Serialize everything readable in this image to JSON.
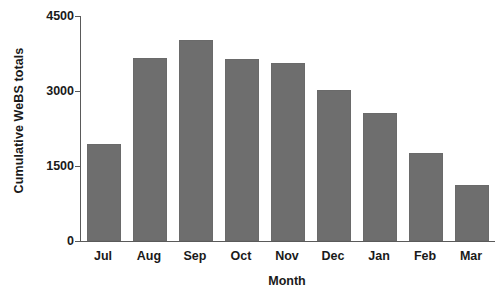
{
  "chart_data": {
    "type": "bar",
    "title": "",
    "xlabel": "Month",
    "ylabel": "Cumulative WeBS totals",
    "categories": [
      "Jul",
      "Aug",
      "Sep",
      "Oct",
      "Nov",
      "Dec",
      "Jan",
      "Feb",
      "Mar"
    ],
    "values": [
      1950,
      3660,
      4020,
      3640,
      3560,
      3020,
      2570,
      1760,
      1120
    ],
    "series": [
      {
        "name": "Cumulative WeBS totals",
        "values": [
          1950,
          3660,
          4020,
          3640,
          3560,
          3020,
          2570,
          1760,
          1120
        ]
      }
    ],
    "ylim": [
      0,
      4500
    ],
    "yticks": [
      0,
      1500,
      3000,
      4500
    ],
    "ytick_labels": [
      "0",
      "1500",
      "3000",
      "4500"
    ],
    "grid": false,
    "legend": false,
    "bar_color": "#6e6e6e",
    "axis_color": "#5a5a5a",
    "text_color": "#1a1a1a"
  }
}
